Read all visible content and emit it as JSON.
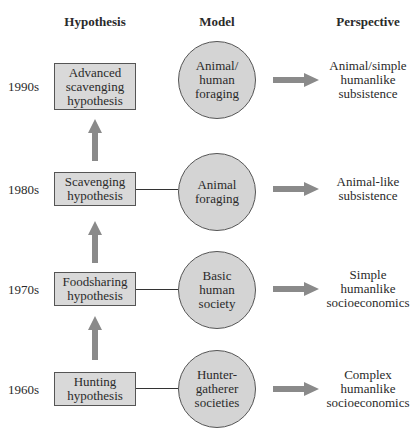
{
  "headers": {
    "hypothesis": "Hypothesis",
    "model": "Model",
    "perspective": "Perspective"
  },
  "rows": [
    {
      "decade": "1990s",
      "hypothesis": [
        "Advanced",
        "scavenging",
        "hypothesis"
      ],
      "model": [
        "Animal/",
        "human",
        "foraging"
      ],
      "perspective": [
        "Animal/simple",
        "humanlike",
        "subsistence"
      ],
      "has_connector": false
    },
    {
      "decade": "1980s",
      "hypothesis": [
        "Scavenging",
        "hypothesis"
      ],
      "model": [
        "Animal",
        "foraging"
      ],
      "perspective": [
        "Animal-like",
        "subsistence"
      ],
      "has_connector": true
    },
    {
      "decade": "1970s",
      "hypothesis": [
        "Foodsharing",
        "hypothesis"
      ],
      "model": [
        "Basic",
        "human",
        "society"
      ],
      "perspective": [
        "Simple",
        "humanlike",
        "socioeconomics"
      ],
      "has_connector": true
    },
    {
      "decade": "1960s",
      "hypothesis": [
        "Hunting",
        "hypothesis"
      ],
      "model": [
        "Hunter-",
        "gatherer",
        "societies"
      ],
      "perspective": [
        "Complex",
        "humanlike",
        "socioeconomics"
      ],
      "has_connector": true
    }
  ],
  "colors": {
    "box_fill": "#d9d9d9",
    "circle_fill": "#d4d4d4",
    "arrow_fill": "#8a8a8a",
    "outline": "#555555"
  }
}
